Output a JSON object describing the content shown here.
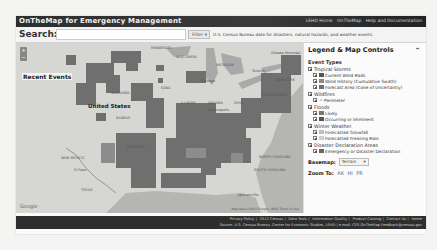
{
  "header": {
    "app_title": "OnTheMap for Emergency Management",
    "links": [
      "LEHD Home",
      "OnTheMap",
      "Help and Documentation"
    ]
  },
  "search": {
    "label": "Search:",
    "placeholder": "",
    "value": "",
    "filter_label": "Filter",
    "description": "U.S. Census Bureau data for disasters, natural hazards, and weather events."
  },
  "map": {
    "overlay_title": "Recent Events",
    "zoom_in": "+",
    "zoom_out": "−",
    "labels": {
      "country": "United States",
      "minnesota": "MINNESOTA",
      "wisconsin": "WISCONSIN",
      "michigan": "MICHIGAN",
      "iowa": "IOWA",
      "nebraska": "NEBRASKA",
      "kansas": "KANSAS",
      "illinois": "ILLINOIS",
      "indiana": "INDIANA",
      "ohio": "OHIO",
      "new_york": "NEW YORK",
      "pennsylvania": "PENNSYLVANIA",
      "new_mexico": "NEW MEXICO",
      "texas": "TEXAS",
      "arkansas": "ARKANSAS",
      "north_carolina": "NORTH CAROLINA",
      "south_carolina": "SOUTH CAROLINA",
      "el_paso": "El Paso",
      "jacksonville": "Jacksonville",
      "toronto": "Toronto",
      "chicago": "Chicago",
      "indianapolis": "Indianapolis",
      "ottawa": "Ottawa Montréal"
    },
    "google_logo": "Google",
    "credit": "Map data ©2015 Google, INEGI  Terms of Use"
  },
  "legend": {
    "title": "Legend & Map Controls",
    "collapse_icon": "^",
    "section_title": "Event Types",
    "groups": [
      {
        "label": "Tropical Storms",
        "checked": true,
        "items": [
          {
            "label": "Current Wind Radii",
            "checked": true,
            "swatch": "#555555"
          },
          {
            "label": "Wind History (Cumulative Swath)",
            "checked": true,
            "swatch": "#8a8a8a"
          },
          {
            "label": "Forecast Area (Cone of Uncertainty)",
            "checked": true,
            "swatch": "#6e6e6e"
          }
        ]
      },
      {
        "label": "Wildfires",
        "checked": true,
        "items": [
          {
            "label": "Perimeter",
            "checked": true,
            "swatch": "#444444"
          }
        ]
      },
      {
        "label": "Floods",
        "checked": true,
        "items": [
          {
            "label": "Likely",
            "checked": true,
            "swatch": "#777777"
          },
          {
            "label": "Occurring or Imminent",
            "checked": true,
            "swatch": "#555555"
          }
        ]
      },
      {
        "label": "Winter Weather",
        "checked": true,
        "items": [
          {
            "label": "Forecasted Snowfall",
            "checked": true,
            "swatch": "#bdbdbd"
          },
          {
            "label": "Forecasted Freezing Rain",
            "checked": true,
            "swatch": "#cfcfcf"
          }
        ]
      },
      {
        "label": "Disaster Declaration Areas",
        "checked": true,
        "items": [
          {
            "label": "Emergency or Disaster Declaration",
            "checked": true,
            "swatch": "#666666"
          }
        ]
      }
    ],
    "basemap_label": "Basemap:",
    "basemap_value": "Terrain",
    "zoom_label": "Zoom To:",
    "zoom_options": [
      "AK",
      "HI",
      "PR"
    ]
  },
  "footer": {
    "line1": [
      "Privacy Policy",
      "2012 Census",
      "Data Tools",
      "Information Quality",
      "Product Catalog",
      "Contact Us",
      "Home"
    ],
    "line2": "Source: U.S. Census Bureau, Center for Economic Studies, LEHD  |  e-mail: CES.OnTheMap.Feedback@census.gov"
  },
  "colors": {
    "topbar": "#2e2e2e",
    "footer": "#2e2e2e",
    "event_fill": "#6f6f6f",
    "map_land": "#d8d8d5",
    "water": "#a9a9a9"
  }
}
